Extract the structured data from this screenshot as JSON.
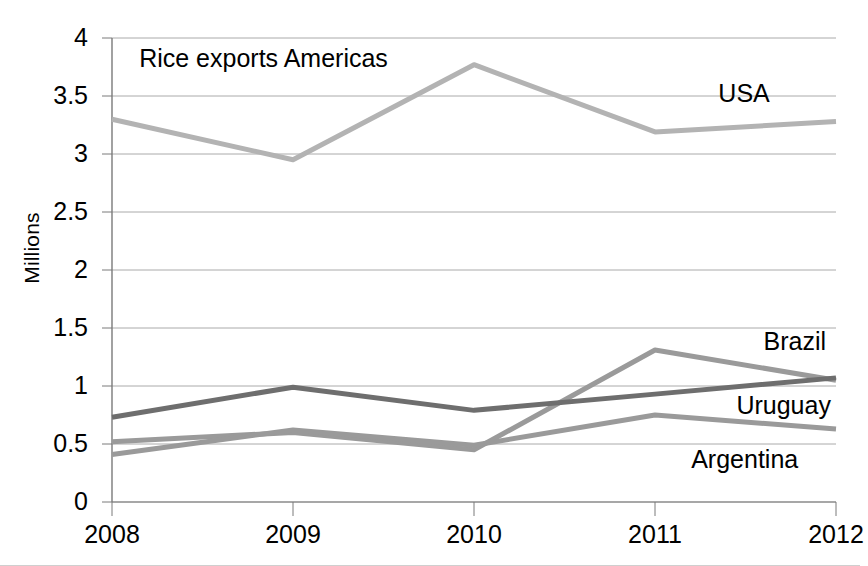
{
  "chart_data": {
    "type": "line",
    "title": "Rice exports Americas",
    "xlabel": "",
    "ylabel": "Millions",
    "categories": [
      "2008",
      "2009",
      "2010",
      "2011",
      "2012"
    ],
    "x": [
      2008,
      2009,
      2010,
      2011,
      2012
    ],
    "ylim": [
      0,
      4
    ],
    "ytick_values": [
      0,
      0.5,
      1,
      1.5,
      2,
      2.5,
      3,
      3.5,
      4
    ],
    "ytick_labels": [
      "0",
      "0.5",
      "1",
      "1.5",
      "2",
      "2.5",
      "3",
      "3.5",
      "4"
    ],
    "grid": "horizontal",
    "legend_position": "inline-right-labels",
    "series": [
      {
        "name": "USA",
        "color": "#b3b3b3",
        "values": [
          3.3,
          2.95,
          3.77,
          3.19,
          3.28
        ],
        "label_x": 2011.35,
        "label_y": 3.52
      },
      {
        "name": "Brazil",
        "color": "#9a9a9a",
        "values": [
          0.52,
          0.6,
          0.45,
          1.31,
          1.05
        ],
        "label_x": 2011.6,
        "label_y": 1.38
      },
      {
        "name": "Uruguay",
        "color": "#6e6e6e",
        "values": [
          0.73,
          0.99,
          0.79,
          0.93,
          1.07
        ],
        "label_x": 2011.45,
        "label_y": 0.83
      },
      {
        "name": "Argentina",
        "color": "#9a9a9a",
        "values": [
          0.41,
          0.62,
          0.49,
          0.75,
          0.63
        ],
        "label_x": 2011.2,
        "label_y": 0.36
      }
    ],
    "annotations": [
      {
        "text": "Rice exports Americas",
        "x": 2008.15,
        "y": 3.82
      }
    ]
  },
  "colors": {
    "gridline": "#aaaaaa",
    "axis": "#7a7a7a",
    "text": "#000000",
    "background": "#ffffff"
  }
}
